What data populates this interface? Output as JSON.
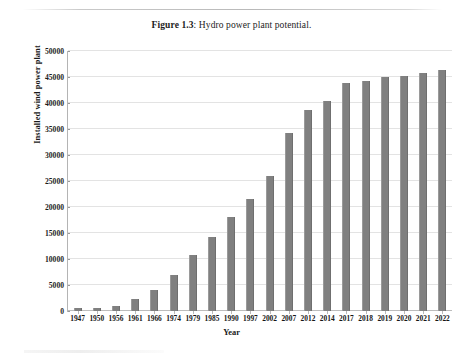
{
  "figure": {
    "label": "Figure 1.3",
    "separator": ": ",
    "caption": "Hydro power plant potential."
  },
  "chart_data": {
    "type": "bar",
    "title": "Figure 1.3: Hydro power plant potential.",
    "xlabel": "Year",
    "ylabel": "Installed wind power plant",
    "ylim": [
      0,
      50000
    ],
    "ytick_step": 5000,
    "yticks": [
      0,
      5000,
      10000,
      15000,
      20000,
      25000,
      30000,
      35000,
      40000,
      45000,
      50000
    ],
    "ytick_labels": [
      "0",
      "5000",
      "10000",
      "15000",
      "20000",
      "25000",
      "30000",
      "35000",
      "40000",
      "45000",
      "50000"
    ],
    "grid": true,
    "legend": false,
    "bar_color": "#808080",
    "categories": [
      "1947",
      "1950",
      "1956",
      "1961",
      "1966",
      "1974",
      "1979",
      "1985",
      "1990",
      "1997",
      "2002",
      "2007",
      "2012",
      "2014",
      "2017",
      "2018",
      "2019",
      "2020",
      "2021",
      "2022"
    ],
    "values": [
      500,
      560,
      1060,
      2300,
      4000,
      7000,
      10800,
      14200,
      18000,
      21500,
      26000,
      34300,
      38700,
      40300,
      43800,
      44300,
      45000,
      45200,
      45800,
      46400
    ]
  }
}
